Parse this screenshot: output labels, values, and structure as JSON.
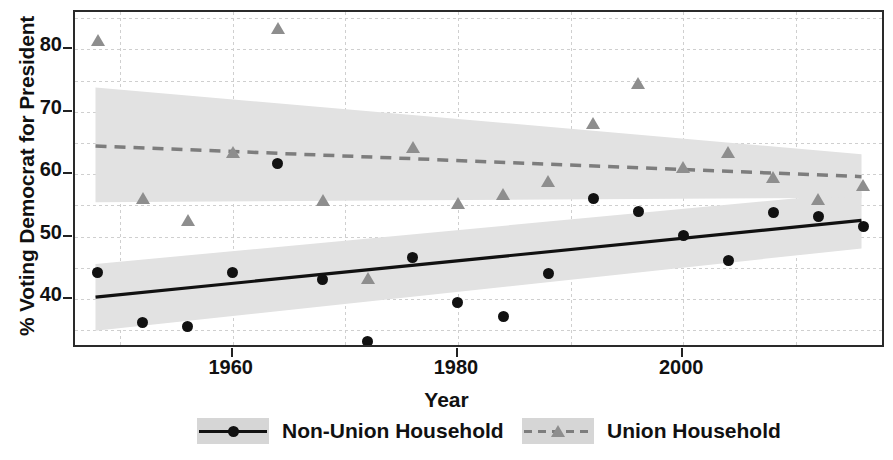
{
  "chart_data": {
    "type": "scatter",
    "title": "",
    "xlabel": "Year",
    "ylabel": "% Voting Democrat for President",
    "xlim": [
      1946,
      2018
    ],
    "ylim": [
      32,
      86
    ],
    "xticks": [
      1960,
      1980,
      2000
    ],
    "xticklabels": [
      "1960",
      "1980",
      "2000"
    ],
    "xminorticks": [
      1950,
      1970,
      1990,
      2010
    ],
    "yticks": [
      40,
      50,
      60,
      70,
      80
    ],
    "yticklabels": [
      "40",
      "50",
      "60",
      "70",
      "80"
    ],
    "yminorticks": [
      35,
      45,
      55,
      65,
      75,
      85
    ],
    "grid": "both-minor-dashed",
    "legend_position": "bottom-center",
    "series": [
      {
        "name": "Non-Union Household",
        "marker": "circle",
        "color": "#111111",
        "line_style": "solid",
        "band_color": "#e2e2e2",
        "points": [
          {
            "x": 1948,
            "y": 44.3
          },
          {
            "x": 1952,
            "y": 36.3
          },
          {
            "x": 1956,
            "y": 35.6
          },
          {
            "x": 1960,
            "y": 44.3
          },
          {
            "x": 1964,
            "y": 61.7
          },
          {
            "x": 1968,
            "y": 43.2
          },
          {
            "x": 1972,
            "y": 33.2
          },
          {
            "x": 1976,
            "y": 46.7
          },
          {
            "x": 1980,
            "y": 39.5
          },
          {
            "x": 1984,
            "y": 37.2
          },
          {
            "x": 1988,
            "y": 44.1
          },
          {
            "x": 1992,
            "y": 56.1
          },
          {
            "x": 1996,
            "y": 54.1
          },
          {
            "x": 2000,
            "y": 50.2
          },
          {
            "x": 2004,
            "y": 46.2
          },
          {
            "x": 2008,
            "y": 53.9
          },
          {
            "x": 2012,
            "y": 53.2
          },
          {
            "x": 2016,
            "y": 51.7
          }
        ],
        "fit_line": {
          "x0": 1948,
          "y0": 40.0,
          "x1": 2016,
          "y1": 52.3
        },
        "band": {
          "x0": 1948,
          "x1": 2016,
          "upper0": 45.3,
          "upper1": 56.8,
          "lower0": 34.6,
          "lower1": 47.8
        }
      },
      {
        "name": "Union Household",
        "marker": "triangle",
        "color": "#8e8e8e",
        "line_style": "dashed",
        "band_color": "#e2e2e2",
        "points": [
          {
            "x": 1948,
            "y": 81.5
          },
          {
            "x": 1952,
            "y": 56.2
          },
          {
            "x": 1956,
            "y": 52.6
          },
          {
            "x": 1960,
            "y": 63.5
          },
          {
            "x": 1964,
            "y": 83.4
          },
          {
            "x": 1968,
            "y": 55.9
          },
          {
            "x": 1972,
            "y": 43.4
          },
          {
            "x": 1976,
            "y": 64.3
          },
          {
            "x": 1980,
            "y": 55.4
          },
          {
            "x": 1984,
            "y": 56.9
          },
          {
            "x": 1988,
            "y": 59.0
          },
          {
            "x": 1992,
            "y": 68.2
          },
          {
            "x": 1996,
            "y": 74.7
          },
          {
            "x": 2000,
            "y": 61.2
          },
          {
            "x": 2004,
            "y": 63.5
          },
          {
            "x": 2008,
            "y": 59.6
          },
          {
            "x": 2012,
            "y": 56.1
          },
          {
            "x": 2016,
            "y": 58.2
          }
        ],
        "fit_line": {
          "x0": 1948,
          "y0": 64.2,
          "x1": 2016,
          "y1": 59.3
        },
        "band": {
          "x0": 1948,
          "x1": 2016,
          "upper0": 73.6,
          "upper1": 62.9,
          "lower0": 55.2,
          "lower1": 55.9
        }
      }
    ]
  },
  "legend": {
    "items": [
      {
        "label": "Non-Union Household",
        "marker": "circle",
        "line": "solid"
      },
      {
        "label": "Union Household",
        "marker": "triangle",
        "line": "dashed"
      }
    ]
  }
}
